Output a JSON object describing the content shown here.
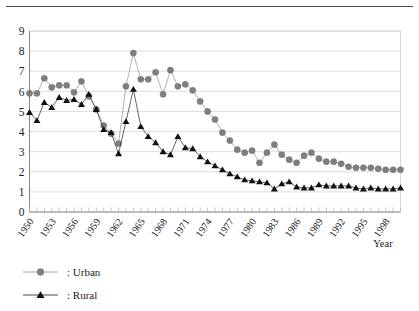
{
  "chart_data": {
    "type": "line",
    "title": "",
    "xlabel": "Year",
    "ylabel": "",
    "ylim": [
      0,
      9
    ],
    "xlim": [
      1950,
      2000
    ],
    "grid": true,
    "legend_position": "bottom-left",
    "y_ticks": [
      "0",
      "1",
      "2",
      "3",
      "4",
      "5",
      "6",
      "7",
      "8",
      "9"
    ],
    "x_tick_labels": [
      "1950",
      "1953",
      "1956",
      "1959",
      "1962",
      "1965",
      "1968",
      "1971",
      "1974",
      "1977",
      "1980",
      "1983",
      "1986",
      "1989",
      "1992",
      "1995",
      "1998"
    ],
    "x": [
      1950,
      1951,
      1952,
      1953,
      1954,
      1955,
      1956,
      1957,
      1958,
      1959,
      1960,
      1961,
      1962,
      1963,
      1964,
      1965,
      1966,
      1967,
      1968,
      1969,
      1970,
      1971,
      1972,
      1973,
      1974,
      1975,
      1976,
      1977,
      1978,
      1979,
      1980,
      1981,
      1982,
      1983,
      1984,
      1985,
      1986,
      1987,
      1988,
      1989,
      1990,
      1991,
      1992,
      1993,
      1994,
      1995,
      1996,
      1997,
      1998,
      1999,
      2000
    ],
    "series": [
      {
        "name": "Urban",
        "marker": "circle",
        "color": "#7f7f7f",
        "values": [
          5.9,
          5.9,
          6.65,
          6.2,
          6.3,
          6.3,
          5.95,
          6.5,
          5.75,
          5.1,
          4.3,
          3.9,
          3.4,
          6.25,
          7.9,
          6.6,
          6.6,
          6.95,
          5.85,
          7.05,
          6.25,
          6.35,
          6.05,
          5.5,
          5.0,
          4.6,
          3.95,
          3.55,
          3.1,
          2.95,
          3.05,
          2.45,
          2.95,
          3.35,
          2.85,
          2.6,
          2.45,
          2.8,
          2.95,
          2.65,
          2.5,
          2.5,
          2.4,
          2.25,
          2.2,
          2.2,
          2.2,
          2.15,
          2.1,
          2.1,
          2.1
        ]
      },
      {
        "name": "Rural",
        "marker": "triangle",
        "color": "#111111",
        "values": [
          4.95,
          4.55,
          5.45,
          5.2,
          5.7,
          5.55,
          5.6,
          5.35,
          5.85,
          5.1,
          4.1,
          3.95,
          2.9,
          4.5,
          6.1,
          4.25,
          3.75,
          3.45,
          3.0,
          2.85,
          3.75,
          3.2,
          3.15,
          2.75,
          2.5,
          2.3,
          2.1,
          1.9,
          1.75,
          1.6,
          1.55,
          1.5,
          1.45,
          1.15,
          1.4,
          1.5,
          1.25,
          1.2,
          1.2,
          1.35,
          1.3,
          1.3,
          1.3,
          1.3,
          1.2,
          1.15,
          1.2,
          1.15,
          1.15,
          1.15,
          1.2
        ]
      }
    ]
  },
  "legend": {
    "items": [
      {
        "label": ": Urban",
        "marker": "circle",
        "color": "#7f7f7f"
      },
      {
        "label": ": Rural",
        "marker": "triangle",
        "color": "#111111"
      }
    ]
  },
  "axis": {
    "x_title": "Year"
  }
}
